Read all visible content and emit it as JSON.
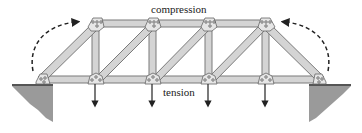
{
  "labels": {
    "top": "compression",
    "bottom": "tension"
  },
  "colors": {
    "member": "#d4d4d4",
    "member_edge": "#7a7a7a",
    "gusset": "#e6e6e6",
    "abutment": "#9a9a9a",
    "arrow": "#222222"
  },
  "truss": {
    "top_joints_x": [
      96,
      153,
      209,
      266
    ],
    "bottom_joints_x": [
      42,
      96,
      153,
      209,
      266,
      320
    ],
    "top_y": 24,
    "bottom_y": 80,
    "load_arrows_x": [
      96,
      153,
      209,
      266
    ]
  }
}
